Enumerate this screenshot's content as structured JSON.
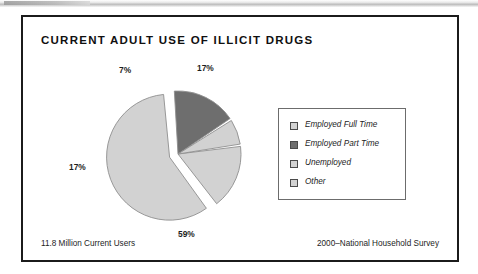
{
  "figure": {
    "title": "CURRENT ADULT USE OF ILLICIT DRUGS",
    "footnote_left": "11.8 Million Current Users",
    "footnote_right": "2000–National Household Survey",
    "frame_color": "#1b1b1b",
    "background": "#ffffff"
  },
  "legend": {
    "position": "right",
    "items": [
      {
        "label": "Employed Full Time",
        "color": "#d2d2d2"
      },
      {
        "label": "Employed Part Time",
        "color": "#6e6e6e"
      },
      {
        "label": "Unemployed",
        "color": "#d2d2d2"
      },
      {
        "label": "Other",
        "color": "#d2d2d2"
      }
    ]
  },
  "chart_data": {
    "type": "pie",
    "title": "CURRENT ADULT USE OF ILLICIT DRUGS",
    "subtitle": "",
    "xlabel": "",
    "ylabel": "",
    "total_label": "11.8 Million Current Users",
    "source": "2000–National Household Survey",
    "units": "percent",
    "categories": [
      "Employed Full Time",
      "Employed Part Time",
      "Unemployed",
      "Other"
    ],
    "values": [
      59,
      17,
      7,
      17
    ],
    "data_labels": [
      "59%",
      "17%",
      "7%",
      "17%"
    ],
    "colors": [
      "#d2d2d2",
      "#6e6e6e",
      "#d2d2d2",
      "#d2d2d2"
    ],
    "slice_border": "#8f8f8f",
    "exploded": [
      true,
      false,
      false,
      false
    ],
    "start_angle_deg": -8,
    "direction": "clockwise",
    "legend_position": "right",
    "grid": false,
    "slices": [
      {
        "category": "Other",
        "value": 17,
        "label": "17%",
        "color": "#d2d2d2",
        "exploded": false,
        "label_x": 138,
        "label_y": 14
      },
      {
        "category": "Employed Full Time",
        "value": 59,
        "label": "59%",
        "color": "#d2d2d2",
        "exploded": true,
        "label_x": 119,
        "label_y": 180
      },
      {
        "category": "Employed Part Time",
        "value": 17,
        "label": "17%",
        "color": "#6e6e6e",
        "exploded": false,
        "label_x": 10,
        "label_y": 113
      },
      {
        "category": "Unemployed",
        "value": 7,
        "label": "7%",
        "color": "#d2d2d2",
        "exploded": false,
        "label_x": 60,
        "label_y": 16
      }
    ]
  }
}
